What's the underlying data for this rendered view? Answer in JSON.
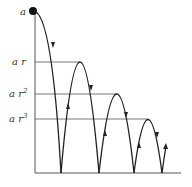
{
  "diagram": {
    "labels": {
      "start": "a",
      "h1_base": "a r",
      "h2_base": "a r",
      "h2_exp": "2",
      "h3_base": "a r",
      "h3_exp": "3"
    },
    "levels": [
      {
        "name": "a",
        "y": 11
      },
      {
        "name": "ar",
        "y": 62
      },
      {
        "name": "ar^2",
        "y": 94
      },
      {
        "name": "ar^3",
        "y": 119
      }
    ],
    "bounce_points_x": [
      61,
      99,
      134,
      162
    ],
    "colors": {
      "line": "#222222",
      "guide": "#666666",
      "text": "#333333"
    }
  }
}
